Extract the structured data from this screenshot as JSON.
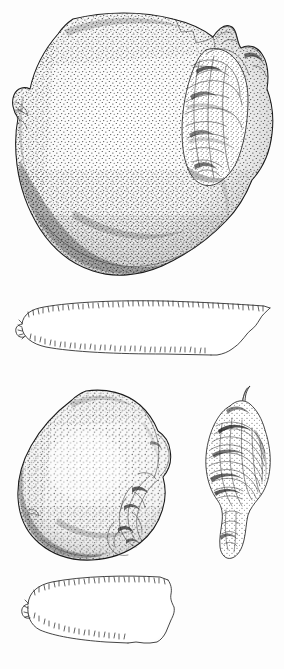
{
  "plate": {
    "title": "Bivalve shell specimen illustration plate",
    "description": "Stippled pen-and-ink scientific illustration plate of two bivalve mollusc valves with their cross-section profiles and a separate hinge detail",
    "medium": "stipple pen-and-ink line drawing",
    "background_color": "#fdfdfd",
    "ink_color": "#1a1a1a",
    "width_px": 284,
    "height_px": 669,
    "labels_present": false,
    "scale_bar_present": false,
    "caption_text": ""
  },
  "figures": [
    {
      "id": "valve-a",
      "name": "upper-valve-exterior-view",
      "label": "",
      "position": {
        "x": 10,
        "y": 10,
        "w": 268,
        "h": 272
      },
      "view": "exterior face view",
      "orientation": "umbo and hinge at right",
      "features": [
        "broadly ovate-subcircular outline",
        "dense uniform stipple over the disc",
        "darker shaded margin along lower-left and ventral edge",
        "eroded / encrusted hinge region with irregular convolutions at right",
        "small notch at left lateral margin",
        "stepped break along upper right margin"
      ]
    },
    {
      "id": "section-a",
      "name": "upper-valve-cross-section",
      "label": "",
      "position": {
        "x": 14,
        "y": 292,
        "w": 262,
        "h": 80
      },
      "view": "transverse cross-section profile",
      "orientation": "dorsal edge uppermost, thick end at right",
      "features": [
        "long low lenticular profile",
        "serrated hatch marks along both cut edges",
        "rounded narrow tip at left",
        "irregular wavy stepped termination at right"
      ]
    },
    {
      "id": "valve-b",
      "name": "lower-valve-exterior-view",
      "label": "",
      "position": {
        "x": 14,
        "y": 388,
        "w": 182,
        "h": 176
      },
      "view": "exterior face view",
      "orientation": "umbo and hinge at right",
      "features": [
        "obliquely ovate outline, smaller than upper valve",
        "even stipple across the disc with lighter central area",
        "shaded darker along the left and ventral margin",
        "damaged corroded hinge margin at right with deep crenulations"
      ]
    },
    {
      "id": "hinge-detail",
      "name": "hinge-detail-view",
      "label": "",
      "position": {
        "x": 196,
        "y": 392,
        "w": 84,
        "h": 170
      },
      "view": "detached hinge / umbonal region, enlarged",
      "orientation": "pointed beak directed upward",
      "features": [
        "narrow elongate outline drawn to a fine upturned beak at top",
        "dense cross-hatched and scribbled interior texture",
        "dark patches marking broken and eroded surfaces",
        "tapering stippled lower extension"
      ]
    },
    {
      "id": "section-b",
      "name": "lower-valve-cross-section",
      "label": "",
      "position": {
        "x": 16,
        "y": 570,
        "w": 172,
        "h": 82
      },
      "view": "transverse cross-section profile",
      "orientation": "dorsal edge uppermost, thick end at right",
      "features": [
        "squat trapezoidal profile",
        "serrated hatch marks along both cut edges",
        "rounded narrow tip at left",
        "stepped notched margin at right"
      ]
    }
  ],
  "colors": {
    "paper": "#fdfdfd",
    "ink": "#1a1a1a",
    "mid_tone": "#6d6d6d",
    "light_tone": "#c9c9c9"
  }
}
